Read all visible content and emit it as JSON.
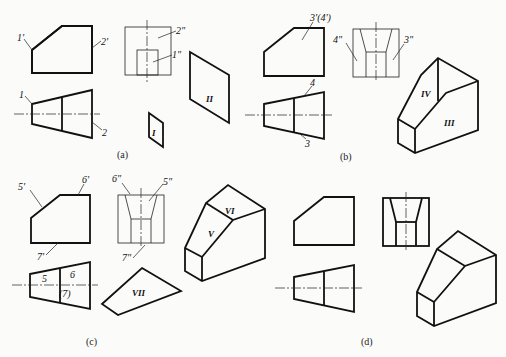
{
  "figure": {
    "panels": [
      {
        "id": "a",
        "caption": "(a)",
        "labels": {
          "front_1": "1'",
          "front_2": "2'",
          "side_2": "2\"",
          "side_1": "1\"",
          "top_1": "1",
          "top_2": "2",
          "face_I": "I",
          "face_II": "II"
        }
      },
      {
        "id": "b",
        "caption": "(b)",
        "labels": {
          "front_34": "3'(4')",
          "side_4": "4\"",
          "side_3": "3\"",
          "top_4": "4",
          "top_3": "3",
          "face_IV": "IV",
          "face_III": "III"
        }
      },
      {
        "id": "c",
        "caption": "(c)",
        "labels": {
          "front_5": "5'",
          "front_6": "6'",
          "front_7": "7'",
          "side_6": "6\"",
          "side_5": "5\"",
          "side_7": "7\"",
          "top_5": "5",
          "top_6": "6",
          "top_7": "(7)",
          "face_V": "V",
          "face_VI": "VI",
          "face_VII": "VII"
        }
      },
      {
        "id": "d",
        "caption": "(d)",
        "labels": {}
      }
    ]
  }
}
